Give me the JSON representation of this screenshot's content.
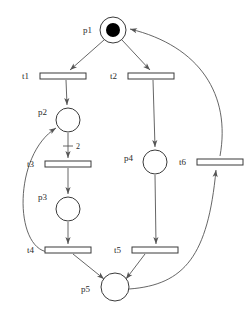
{
  "diagram": {
    "type": "petri-net",
    "width": 246,
    "height": 317,
    "background_color": "#ffffff",
    "stroke_color": "#555555",
    "node_stroke_color": "#3a3a3a",
    "token_color": "#000000",
    "label_color": "#2b2b2b"
  },
  "places": [
    {
      "id": "p1",
      "label": "p1",
      "cx": 113,
      "cy": 30,
      "r": 13,
      "tokens": 1,
      "token_r": 7,
      "label_x": 92,
      "label_y": 33
    },
    {
      "id": "p2",
      "label": "p2",
      "cx": 68,
      "cy": 120,
      "r": 12,
      "tokens": 0,
      "token_r": 0,
      "label_x": 47,
      "label_y": 115
    },
    {
      "id": "p3",
      "label": "p3",
      "cx": 68,
      "cy": 209,
      "r": 12,
      "tokens": 0,
      "token_r": 0,
      "label_x": 47,
      "label_y": 200
    },
    {
      "id": "p4",
      "label": "p4",
      "cx": 155,
      "cy": 162,
      "r": 12,
      "tokens": 0,
      "token_r": 0,
      "label_x": 133,
      "label_y": 161
    },
    {
      "id": "p5",
      "label": "p5",
      "cx": 115,
      "cy": 287,
      "r": 14,
      "tokens": 0,
      "token_r": 0,
      "label_x": 90,
      "label_y": 292
    }
  ],
  "transitions": [
    {
      "id": "t1",
      "label": "t1",
      "x": 40,
      "y": 73,
      "w": 46,
      "h": 6,
      "label_x": 29,
      "label_y": 79
    },
    {
      "id": "t2",
      "label": "t2",
      "x": 128,
      "y": 73,
      "w": 46,
      "h": 6,
      "label_x": 117,
      "label_y": 79
    },
    {
      "id": "t3",
      "label": "t3",
      "x": 45,
      "y": 161,
      "w": 46,
      "h": 6,
      "label_x": 34,
      "label_y": 167
    },
    {
      "id": "t4",
      "label": "t4",
      "x": 45,
      "y": 247,
      "w": 46,
      "h": 6,
      "label_x": 34,
      "label_y": 253
    },
    {
      "id": "t5",
      "label": "t5",
      "x": 132,
      "y": 247,
      "w": 46,
      "h": 6,
      "label_x": 121,
      "label_y": 253
    },
    {
      "id": "t6",
      "label": "t6",
      "x": 197,
      "y": 159,
      "w": 46,
      "h": 6,
      "label_x": 186,
      "label_y": 165
    }
  ],
  "arcs": [
    {
      "id": "a1",
      "from": "p1",
      "to": "t1",
      "kind": "line",
      "weight": "",
      "path": "M 104 40 L 70 70"
    },
    {
      "id": "a2",
      "from": "p1",
      "to": "t2",
      "kind": "line",
      "weight": "",
      "path": "M 122 40 L 150 70"
    },
    {
      "id": "a3",
      "from": "t1",
      "to": "p2",
      "kind": "line",
      "weight": "",
      "path": "M 66 80 L 67 105"
    },
    {
      "id": "a4",
      "from": "p2",
      "to": "t3",
      "kind": "line",
      "weight": "2",
      "path": "M 68 133 L 68 158",
      "weight_x": 76,
      "weight_y": 146,
      "tick_x1": 63,
      "tick_x2": 73,
      "tick_y": 146
    },
    {
      "id": "a5",
      "from": "t3",
      "to": "p3",
      "kind": "line",
      "weight": "",
      "path": "M 68 168 L 68 194"
    },
    {
      "id": "a6",
      "from": "p3",
      "to": "t4",
      "kind": "line",
      "weight": "",
      "path": "M 68 222 L 68 244"
    },
    {
      "id": "a7",
      "from": "t4",
      "to": "p5",
      "kind": "line",
      "weight": "",
      "path": "M 73 254 L 104 279"
    },
    {
      "id": "a8",
      "from": "t2",
      "to": "p4",
      "kind": "line",
      "weight": "",
      "path": "M 153 80 L 155 147"
    },
    {
      "id": "a9",
      "from": "p4",
      "to": "t5",
      "kind": "line",
      "weight": "",
      "path": "M 155 175 L 156 244"
    },
    {
      "id": "a10",
      "from": "t5",
      "to": "p5",
      "kind": "line",
      "weight": "",
      "path": "M 145 254 L 126 279"
    },
    {
      "id": "a11",
      "from": "t4",
      "to": "p2",
      "kind": "curve",
      "weight": "",
      "path": "M 48 252 C 14 248 13 155 56 128"
    },
    {
      "id": "a12",
      "from": "p5",
      "to": "t6",
      "kind": "curve",
      "weight": "",
      "path": "M 129 289 C 185 285 208 255 216 170"
    },
    {
      "id": "a13",
      "from": "t6",
      "to": "p1",
      "kind": "curve",
      "weight": "",
      "path": "M 220 156 C 231 95 200 46 130 29"
    }
  ],
  "arrowheads": [
    {
      "id": "ah1",
      "arc": "a1",
      "x": 70,
      "y": 70,
      "angle": 139
    },
    {
      "id": "ah2",
      "arc": "a2",
      "x": 150,
      "y": 70,
      "angle": 45
    },
    {
      "id": "ah3",
      "arc": "a3",
      "x": 67,
      "y": 105,
      "angle": 88
    },
    {
      "id": "ah4",
      "arc": "a4",
      "x": 68,
      "y": 158,
      "angle": 90
    },
    {
      "id": "ah5",
      "arc": "a5",
      "x": 68,
      "y": 194,
      "angle": 90
    },
    {
      "id": "ah6",
      "arc": "a6",
      "x": 68,
      "y": 244,
      "angle": 90
    },
    {
      "id": "ah7",
      "arc": "a7",
      "x": 104,
      "y": 279,
      "angle": 39
    },
    {
      "id": "ah8",
      "arc": "a8",
      "x": 155,
      "y": 147,
      "angle": 88
    },
    {
      "id": "ah9",
      "arc": "a9",
      "x": 156,
      "y": 244,
      "angle": 89
    },
    {
      "id": "ah10",
      "arc": "a10",
      "x": 126,
      "y": 279,
      "angle": 127
    },
    {
      "id": "ah11",
      "arc": "a11",
      "x": 56,
      "y": 128,
      "angle": -33
    },
    {
      "id": "ah12",
      "arc": "a12",
      "x": 216,
      "y": 170,
      "angle": -83
    },
    {
      "id": "ah13",
      "arc": "a13",
      "x": 130,
      "y": 29,
      "angle": 194
    }
  ]
}
